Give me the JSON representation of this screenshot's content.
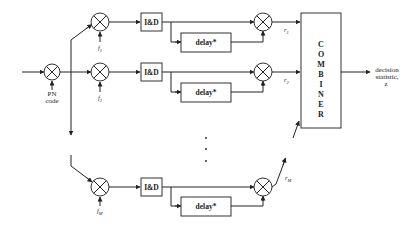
{
  "diagram": {
    "title": "",
    "input": {
      "mixer_label_line1": "PN",
      "mixer_label_line2": "code"
    },
    "branches": [
      {
        "freq_label": "f",
        "freq_sub": "1",
        "id_label": "I&D",
        "delay_label": "delay*",
        "output_label": "r",
        "output_sub": "1"
      },
      {
        "freq_label": "f",
        "freq_sub": "2",
        "id_label": "I&D",
        "delay_label": "delay*",
        "output_label": "r",
        "output_sub": "2"
      },
      {
        "freq_label": "f",
        "freq_sub": "M",
        "id_label": "I&D",
        "delay_label": "delay*",
        "output_label": "r",
        "output_sub": "M"
      }
    ],
    "ellipsis": "⋮",
    "combiner": {
      "letters": [
        "C",
        "O",
        "M",
        "B",
        "I",
        "N",
        "E",
        "R"
      ]
    },
    "output": {
      "line1": "decision",
      "line2": "statistic,",
      "line3": "z"
    }
  }
}
